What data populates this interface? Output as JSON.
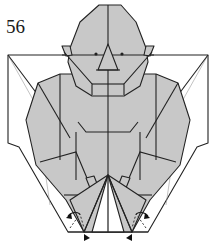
{
  "diagram": {
    "step_number": "56",
    "colors": {
      "paper_colored": "#c8c8c8",
      "paper_white": "#ffffff",
      "line": "#222222"
    },
    "symbols": [
      "valley-fold-dashed-lines",
      "fold-arrows",
      "push-arrow-marks",
      "reference-crease-lines"
    ]
  }
}
